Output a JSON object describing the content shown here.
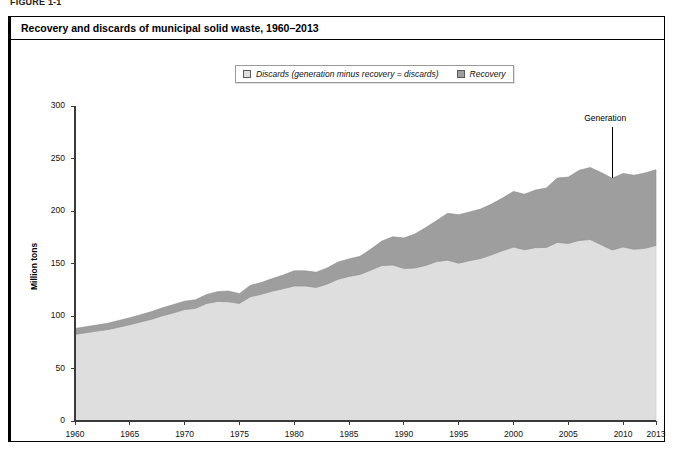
{
  "figure": {
    "label": "FIGURE 1-1"
  },
  "chart_title": "Recovery and discards of municipal solid waste, 1960–2013",
  "legend": {
    "position": "top-center",
    "items": [
      {
        "label": "Discards (generation minus recovery = discards)",
        "color": "#dedede",
        "swatch_name": "discards-swatch"
      },
      {
        "label": "Recovery",
        "color": "#9e9e9e",
        "swatch_name": "recovery-swatch"
      }
    ]
  },
  "annotations": [
    {
      "text": "Generation",
      "x_year": 2009,
      "y_value": 280,
      "name": "generation-annotation"
    }
  ],
  "axes": {
    "y": {
      "title": "Million tons",
      "min": 0,
      "max": 300,
      "ticks": [
        0,
        50,
        100,
        150,
        200,
        250,
        300
      ],
      "tick_labels": [
        "0",
        "50",
        "100",
        "150",
        "200",
        "250",
        "300"
      ]
    },
    "x": {
      "title": "",
      "min": 1960,
      "max": 2013,
      "ticks": [
        1960,
        1965,
        1970,
        1975,
        1980,
        1985,
        1990,
        1995,
        2000,
        2005,
        2010,
        2013
      ],
      "tick_labels": [
        "1960",
        "1965",
        "1970",
        "1975",
        "1980",
        "1985",
        "1990",
        "1995",
        "2000",
        "2005",
        "2010",
        "2013"
      ]
    }
  },
  "chart_data": {
    "type": "area",
    "stacked": true,
    "title": "Recovery and discards of municipal solid waste, 1960–2013",
    "xlabel": "",
    "ylabel": "Million tons",
    "xlim": [
      1960,
      2013
    ],
    "ylim": [
      0,
      300
    ],
    "grid": false,
    "legend_position": "top-center",
    "x": [
      1960,
      1961,
      1962,
      1963,
      1964,
      1965,
      1966,
      1967,
      1968,
      1969,
      1970,
      1971,
      1972,
      1973,
      1974,
      1975,
      1976,
      1977,
      1978,
      1979,
      1980,
      1981,
      1982,
      1983,
      1984,
      1985,
      1986,
      1987,
      1988,
      1989,
      1990,
      1991,
      1992,
      1993,
      1994,
      1995,
      1996,
      1997,
      1998,
      1999,
      2000,
      2001,
      2002,
      2003,
      2004,
      2005,
      2006,
      2007,
      2008,
      2009,
      2010,
      2011,
      2012,
      2013
    ],
    "series": [
      {
        "name": "Discards (generation minus recovery = discards)",
        "color": "#dedede",
        "values": [
          82.5,
          84.1,
          85.6,
          87.1,
          89.4,
          91.7,
          94.4,
          97.0,
          100.3,
          103.0,
          106.1,
          107.3,
          111.9,
          113.9,
          113.5,
          112.0,
          118.4,
          120.6,
          123.7,
          126.0,
          128.6,
          128.6,
          127.2,
          130.4,
          135.0,
          137.7,
          139.6,
          143.7,
          148.1,
          148.5,
          145.3,
          145.7,
          148.2,
          151.8,
          153.2,
          150.3,
          152.7,
          154.7,
          158.3,
          162.2,
          165.6,
          163.1,
          165.1,
          165.3,
          170.1,
          169.1,
          172.0,
          172.8,
          167.9,
          162.9,
          165.7,
          163.5,
          164.5,
          167.1
        ]
      },
      {
        "name": "Recovery",
        "color": "#9e9e9e",
        "values": [
          5.6,
          5.7,
          5.8,
          6.0,
          6.3,
          6.6,
          6.9,
          7.2,
          7.6,
          7.9,
          8.0,
          8.2,
          8.6,
          9.3,
          10.3,
          9.3,
          10.8,
          11.3,
          11.9,
          13.0,
          14.5,
          14.4,
          14.5,
          15.3,
          16.4,
          16.7,
          17.2,
          20.1,
          23.3,
          27.0,
          29.0,
          32.4,
          36.1,
          39.1,
          44.6,
          46.1,
          46.4,
          47.1,
          48.3,
          50.1,
          53.0,
          52.9,
          54.8,
          56.7,
          61.3,
          63.2,
          66.8,
          68.6,
          68.7,
          68.2,
          70.1,
          70.5,
          71.7,
          72.2
        ]
      }
    ],
    "generation_total": [
      88.1,
      89.8,
      91.4,
      93.1,
      95.7,
      98.3,
      101.3,
      104.2,
      107.9,
      110.9,
      114.1,
      115.5,
      120.5,
      123.2,
      123.8,
      121.3,
      129.2,
      131.9,
      135.6,
      139.0,
      143.1,
      143.0,
      141.7,
      145.7,
      151.4,
      154.4,
      156.8,
      163.8,
      171.4,
      175.5,
      174.3,
      178.1,
      184.3,
      190.9,
      197.8,
      196.4,
      199.1,
      201.8,
      206.6,
      212.3,
      218.6,
      216.0,
      219.9,
      222.0,
      231.4,
      232.3,
      238.8,
      241.4,
      236.6,
      231.1,
      235.8,
      234.0,
      236.2,
      239.3
    ]
  }
}
